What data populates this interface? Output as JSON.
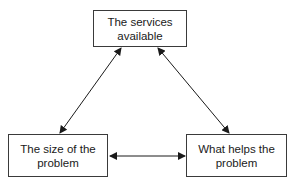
{
  "diagram": {
    "nodes": [
      {
        "id": "services",
        "label": "The services available",
        "line1": "The services",
        "line2": "available"
      },
      {
        "id": "size",
        "label": "The size of the problem",
        "line1": "The size of the",
        "line2": "problem"
      },
      {
        "id": "helps",
        "label": "What helps the problem",
        "line1": "What helps the",
        "line2": "problem"
      }
    ],
    "edges": [
      {
        "from": "services",
        "to": "size",
        "type": "bidirectional"
      },
      {
        "from": "services",
        "to": "helps",
        "type": "bidirectional"
      },
      {
        "from": "size",
        "to": "helps",
        "type": "bidirectional"
      }
    ],
    "colors": {
      "stroke": "#1a1a1a",
      "background": "#ffffff"
    }
  }
}
